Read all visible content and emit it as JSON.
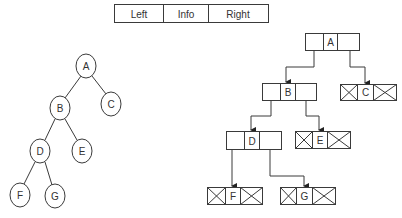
{
  "legend": {
    "cells": [
      "Left",
      "Info",
      "Right"
    ]
  },
  "left_tree": {
    "nodes": [
      {
        "id": "A",
        "label": "A"
      },
      {
        "id": "B",
        "label": "B"
      },
      {
        "id": "C",
        "label": "C"
      },
      {
        "id": "D",
        "label": "D"
      },
      {
        "id": "E",
        "label": "E"
      },
      {
        "id": "F",
        "label": "F"
      },
      {
        "id": "G",
        "label": "G"
      }
    ],
    "edges": [
      [
        "A",
        "B"
      ],
      [
        "A",
        "C"
      ],
      [
        "B",
        "D"
      ],
      [
        "B",
        "E"
      ],
      [
        "D",
        "F"
      ],
      [
        "D",
        "G"
      ]
    ]
  },
  "linked_tree": {
    "nodes": [
      {
        "id": "A",
        "label": "A",
        "left": "B",
        "right": "C"
      },
      {
        "id": "B",
        "label": "B",
        "left": "D",
        "right": "E"
      },
      {
        "id": "C",
        "label": "C",
        "left": null,
        "right": null
      },
      {
        "id": "D",
        "label": "D",
        "left": "F",
        "right": "G"
      },
      {
        "id": "E",
        "label": "E",
        "left": null,
        "right": null
      },
      {
        "id": "F",
        "label": "F",
        "left": null,
        "right": null
      },
      {
        "id": "G",
        "label": "G",
        "left": null,
        "right": null
      }
    ]
  }
}
